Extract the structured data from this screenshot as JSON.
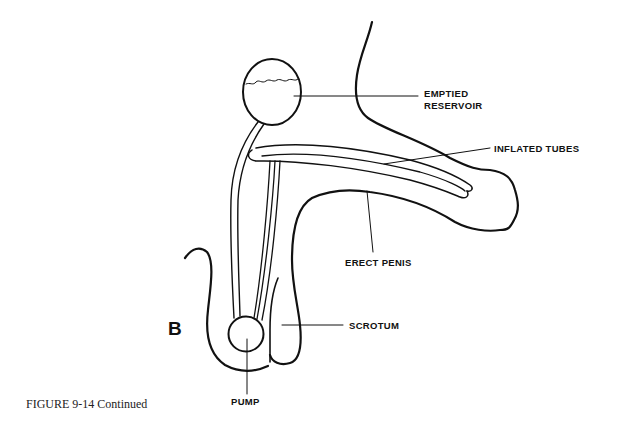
{
  "figure": {
    "caption": "FIGURE 9-14 Continued",
    "panel_letter": "B"
  },
  "labels": {
    "reservoir_line1": "EMPTIED",
    "reservoir_line2": "RESERVOIR",
    "tubes": "INFLATED TUBES",
    "penis": "ERECT PENIS",
    "scrotum": "SCROTUM",
    "pump": "PUMP"
  },
  "colors": {
    "stroke": "#111111",
    "background": "#ffffff"
  }
}
